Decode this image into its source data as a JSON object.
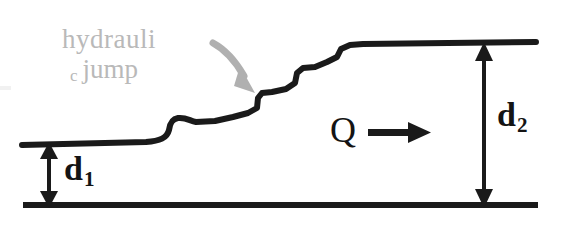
{
  "diagram": {
    "title_text_present": false,
    "colors": {
      "ink": "#141414",
      "annotation_gray": "#b9b9b9",
      "background": "#ffffff"
    },
    "labels": {
      "jump_line1": "hydrauli",
      "jump_subscript_c": "c",
      "jump_line2": "jump",
      "upstream_depth": "d",
      "upstream_depth_subscript": "1",
      "downstream_depth": "d",
      "downstream_depth_subscript": "2",
      "discharge": "Q"
    },
    "icons": {
      "callout_arrow": "curved-arrow-down-right-icon",
      "flow_arrow": "arrow-right-icon",
      "depth_arrow_d1": "double-headed-vertical-arrow-icon",
      "depth_arrow_d2": "double-headed-vertical-arrow-icon"
    },
    "geometry": {
      "channel_bed_y": 205,
      "upstream_surface_y": 145,
      "downstream_surface_y": 44,
      "bed_x_start": 23,
      "bed_x_end": 538,
      "upstream_surface_x_start": 22,
      "downstream_surface_x_end": 536,
      "d1_arrow_x": 49,
      "d2_arrow_x": 484
    }
  }
}
